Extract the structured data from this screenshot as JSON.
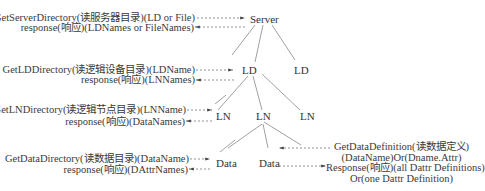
{
  "diagram": {
    "nodes": {
      "server": "Server",
      "ld1": "LD",
      "ld2": "LD",
      "ld3": "LD",
      "ln1": "LN",
      "ln2": "LN",
      "ln3": "LN",
      "data1": "Data",
      "data2": "Data"
    },
    "requests": {
      "server_request": "GetServerDirectory(读服务器目录)(LD or File)",
      "server_response": "response(响应)(LDNames or FileNames)",
      "ld_request": "GetLDDirectory(读逻辑设备目录)(LDName)",
      "ld_response": "response(响应)(LNNames)",
      "ln_request": "GetLNDirectory(读逻辑节点目录)(LNName)",
      "ln_response": "response(响应)(DataNames)",
      "data_request": "GetDataDirectory(读数据目录)(DataName)",
      "data_response": "response(响应)(DAttrNames)",
      "def_request_line1": "GetDataDefinition(读数据定义)",
      "def_request_line2": "(DataName)Or(Dname.Attr)",
      "def_response_line1": "Response(响应)(all Dattr Definitions)",
      "def_response_line2": "Or(one Dattr Definition)"
    }
  }
}
